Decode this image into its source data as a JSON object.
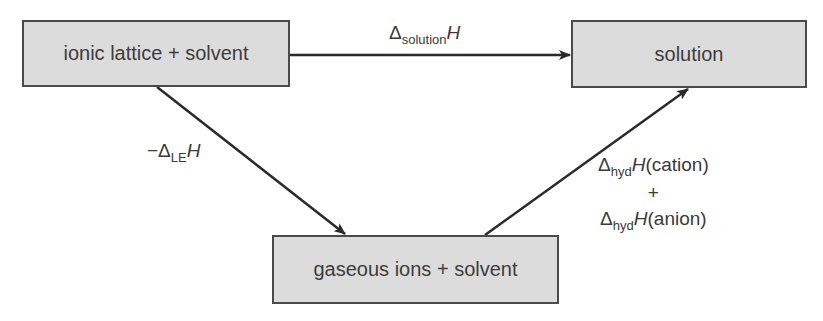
{
  "diagram": {
    "type": "enthalpy-cycle",
    "nodes": {
      "lattice": {
        "label": "ionic lattice + solvent"
      },
      "solution": {
        "label": "solution"
      },
      "gaseous": {
        "label": "gaseous ions + solvent"
      }
    },
    "edges": {
      "solution_enthalpy": {
        "from": "lattice",
        "to": "solution",
        "prefix": "",
        "delta": "Δ",
        "subscript": "solution",
        "symbol": "H"
      },
      "lattice_enthalpy": {
        "from": "lattice",
        "to": "gaseous",
        "prefix": "−",
        "delta": "Δ",
        "subscript": "LE",
        "symbol": "H"
      },
      "hydration_enthalpy": {
        "from": "gaseous",
        "to": "solution",
        "line1": {
          "delta": "Δ",
          "subscript": "hyd",
          "symbol": "H",
          "suffix": "(cation)"
        },
        "plus": "+",
        "line2": {
          "delta": "Δ",
          "subscript": "hyd",
          "symbol": "H",
          "suffix": "(anion)"
        }
      }
    },
    "colors": {
      "box_fill": "#dcdcdc",
      "box_border": "#4a4a4a",
      "arrow": "#2a2a2a",
      "text": "#3a3a3a"
    }
  }
}
